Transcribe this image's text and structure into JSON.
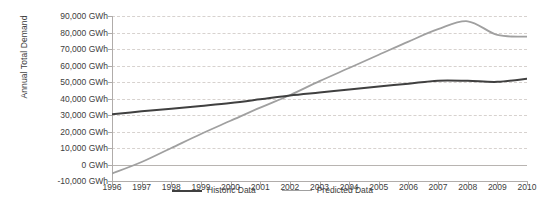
{
  "chart_data": {
    "type": "line",
    "title": "",
    "xlabel": "",
    "ylabel": "Annual Total Demand",
    "unit": "GWh",
    "grid": true,
    "legend_position": "bottom",
    "categories": [
      "1996",
      "1997",
      "1998",
      "1999",
      "2000",
      "2001",
      "2002",
      "2003",
      "2004",
      "2005",
      "2006",
      "2007",
      "2008",
      "2009",
      "2010"
    ],
    "x": [
      1996,
      1997,
      1998,
      1999,
      2000,
      2001,
      2002,
      2003,
      2004,
      2005,
      2006,
      2007,
      2008,
      2009,
      2010
    ],
    "ylim": [
      -10000,
      90000
    ],
    "ytick_values": [
      90000,
      80000,
      70000,
      60000,
      50000,
      40000,
      30000,
      20000,
      10000,
      0,
      -10000
    ],
    "ytick_labels": [
      "90,000 GWh",
      "80,000 GWh",
      "70,000 GWh",
      "60,000 GWh",
      "50,000 GWh",
      "40,000 GWh",
      "30,000 GWh",
      "20,000 GWh",
      "10,000 GWh",
      "0 GWh",
      "-10,000 GWh"
    ],
    "series": [
      {
        "name": "Historic Data",
        "color": "#404040",
        "width": 2.0,
        "values": [
          30500,
          32200,
          33800,
          35500,
          37300,
          39500,
          41800,
          43600,
          45400,
          47200,
          49000,
          50800,
          50700,
          50100,
          52000
        ]
      },
      {
        "name": "Predicted Data",
        "color": "#a0a0a0",
        "width": 1.8,
        "values": [
          -5500,
          1500,
          10000,
          18500,
          26500,
          34500,
          42000,
          50500,
          58500,
          66500,
          74500,
          82000,
          86800,
          78500,
          77500
        ]
      }
    ]
  },
  "legend": {
    "entries": [
      {
        "label": "Historic Data",
        "color": "#404040"
      },
      {
        "label": "Predicted Data",
        "color": "#a0a0a0"
      }
    ]
  }
}
